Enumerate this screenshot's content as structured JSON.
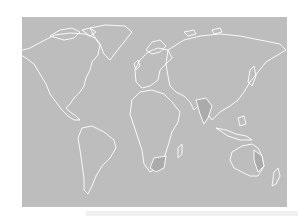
{
  "map": {
    "title": "World map outline",
    "projection": "equirectangular-like",
    "colors": {
      "background": "#ffffff",
      "ocean": "#bdbdbd",
      "land": "#bdbdbd",
      "coastline": "#ffffff",
      "highlight": "#a9a9a9"
    },
    "highlighted_regions": [
      "India",
      "South Africa",
      "Eastern Australia"
    ],
    "regions": [
      "North America",
      "Greenland",
      "South America",
      "Europe",
      "Africa",
      "Asia",
      "Australia",
      "New Zealand"
    ]
  },
  "caption": {
    "text": ""
  }
}
